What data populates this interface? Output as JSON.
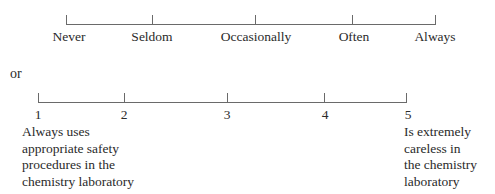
{
  "scale1": {
    "labels": [
      "Never",
      "Seldom",
      "Occasionally",
      "Often",
      "Always"
    ]
  },
  "connector": "or",
  "scale2": {
    "numbers": [
      "1",
      "2",
      "3",
      "4",
      "5"
    ],
    "left_anchor": "Always uses\nappropriate safety\nprocedures in the\nchemistry laboratory",
    "right_anchor": "Is extremely\ncareless in\nthe chemistry\nlaboratory"
  },
  "colors": {
    "text": "#2a2a2a",
    "line": "#6a6a6a",
    "background": "#ffffff"
  }
}
